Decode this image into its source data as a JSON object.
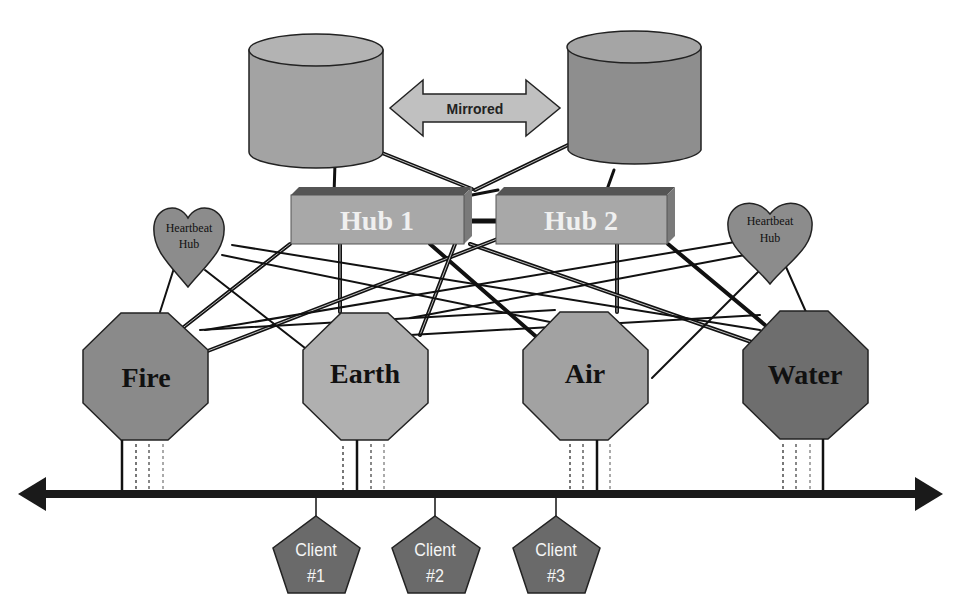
{
  "diagram": {
    "databases": [
      {
        "id": "db-left",
        "label": ""
      },
      {
        "id": "db-right",
        "label": ""
      }
    ],
    "mirror_arrow": {
      "label": "Mirrored"
    },
    "hubs": [
      {
        "id": "hub-1",
        "label": "Hub 1"
      },
      {
        "id": "hub-2",
        "label": "Hub 2"
      }
    ],
    "heartbeat_hubs": [
      {
        "id": "heartbeat-left",
        "line1": "Heartbeat",
        "line2": "Hub"
      },
      {
        "id": "heartbeat-right",
        "line1": "Heartbeat",
        "line2": "Hub"
      }
    ],
    "servers": [
      {
        "id": "fire",
        "label": "Fire"
      },
      {
        "id": "earth",
        "label": "Earth"
      },
      {
        "id": "air",
        "label": "Air"
      },
      {
        "id": "water",
        "label": "Water"
      }
    ],
    "clients": [
      {
        "id": "client-1",
        "line1": "Client",
        "line2": "#1"
      },
      {
        "id": "client-2",
        "line1": "Client",
        "line2": "#2"
      },
      {
        "id": "client-3",
        "line1": "Client",
        "line2": "#3"
      }
    ],
    "colors": {
      "database_body": "#a3a3a3",
      "database_top": "#b3b3b3",
      "database_right_body": "#8e8e8e",
      "hub_face": "#a8a8a8",
      "hub_top": "#5a5a5a",
      "hub_side": "#7a7a7a",
      "heart": "#8c8c8c",
      "fire": "#8a8a8a",
      "earth": "#b0b0b0",
      "air": "#a2a2a2",
      "water": "#6e6e6e",
      "client": "#6a6a6a",
      "line": "#111111",
      "arrow_fill": "#c0c0c0"
    }
  }
}
